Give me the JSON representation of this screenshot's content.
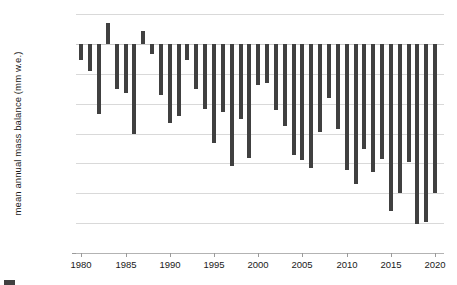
{
  "chart_data": {
    "type": "bar",
    "title": "",
    "xlabel": "",
    "ylabel": "mean annual mass balance (mm w.e.)",
    "ylim": [
      -1400,
      200
    ],
    "xlim": [
      1979.4,
      2021.0
    ],
    "ytick_values": [
      200,
      0,
      -200,
      -400,
      -600,
      -800,
      -1000,
      -1200,
      -1400
    ],
    "ytick_labels": [
      "200",
      "0",
      "-200",
      "-400",
      "-600",
      "-800",
      "-1000",
      "-1200",
      "-1400"
    ],
    "xtick_values": [
      1980,
      1985,
      1990,
      1995,
      2000,
      2005,
      2010,
      2015,
      2020
    ],
    "xtick_labels": [
      "1980",
      "1985",
      "1990",
      "1995",
      "2000",
      "2005",
      "2010",
      "2015",
      "2020"
    ],
    "grid": true,
    "legend": "none",
    "bar_color": "#404040",
    "grid_color": "#d9d9d9",
    "axis_color": "#b3b3b3",
    "categories": [
      1980,
      1981,
      1982,
      1983,
      1984,
      1985,
      1986,
      1987,
      1988,
      1989,
      1990,
      1991,
      1992,
      1993,
      1994,
      1995,
      1996,
      1997,
      1998,
      1999,
      2000,
      2001,
      2002,
      2003,
      2004,
      2005,
      2006,
      2007,
      2008,
      2009,
      2010,
      2011,
      2012,
      2013,
      2014,
      2015,
      2016,
      2017,
      2018,
      2019,
      2020
    ],
    "values": [
      -110,
      -180,
      -470,
      140,
      -300,
      -330,
      -600,
      85,
      -65,
      -345,
      -530,
      -480,
      -110,
      -305,
      -435,
      -665,
      -455,
      -820,
      -500,
      -765,
      -275,
      -260,
      -445,
      -550,
      -745,
      -780,
      -830,
      -590,
      -365,
      -570,
      -845,
      -940,
      -705,
      -855,
      -770,
      -1120,
      -1000,
      -790,
      -1205,
      -1190,
      -1000
    ]
  }
}
